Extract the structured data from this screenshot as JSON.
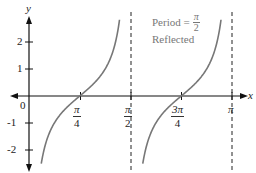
{
  "chart_data": {
    "type": "line",
    "title": "",
    "function": "y = -cot(2x)",
    "xlabel": "x",
    "ylabel": "y",
    "xlim": [
      0,
      3.14159
    ],
    "ylim": [
      -2.6,
      2.9
    ],
    "x_ticks": [
      {
        "value": 0.7854,
        "num": "π",
        "den": "4"
      },
      {
        "value": 1.5708,
        "num": "π",
        "den": "2"
      },
      {
        "value": 2.3562,
        "num": "3π",
        "den": "4"
      },
      {
        "value": 3.1416,
        "label": "π"
      }
    ],
    "y_ticks": [
      2,
      1,
      -1,
      -2
    ],
    "origin_label": "0",
    "asymptotes": [
      1.5708,
      3.1416
    ],
    "zeros": [
      0.7854,
      2.3562
    ],
    "annotation": {
      "line1_prefix": "Period =",
      "period_num": "π",
      "period_den": "2",
      "line2": "Reflected"
    },
    "grid": false,
    "colors": {
      "curve": "#777777",
      "axes": "#111111",
      "asymptote": "#222222",
      "annotation": "#777777"
    }
  }
}
